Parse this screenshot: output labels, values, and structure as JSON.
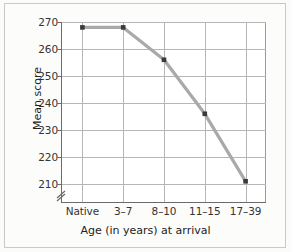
{
  "chart_data": {
    "type": "line",
    "title": "",
    "xlabel": "Age (in years) at arrival",
    "ylabel": "Mean score",
    "categories": [
      "Native",
      "3–7",
      "8–10",
      "11–15",
      "17–39"
    ],
    "values": [
      268,
      268,
      256,
      236,
      211
    ],
    "series": [
      {
        "name": "Mean score",
        "values": [
          268,
          268,
          256,
          236,
          211
        ]
      }
    ],
    "yticks": [
      210,
      220,
      230,
      240,
      250,
      260,
      270
    ],
    "ylim": [
      205,
      272
    ],
    "ytick_labels": [
      "210",
      "220",
      "230",
      "240",
      "250",
      "260",
      "270"
    ],
    "grid": true,
    "legend": false,
    "axis_break": true,
    "line_color": "#a9a9a9",
    "marker_color": "#3a3a3a",
    "grid_color": "#b6b6b6",
    "axis_color": "#6b6b6b",
    "background": "#ffffff"
  },
  "figure": {
    "frame_color": "#c9c9c9",
    "page_background": "#fbfbfa"
  },
  "icons": {
    "axis_break": "axis-break-icon"
  }
}
